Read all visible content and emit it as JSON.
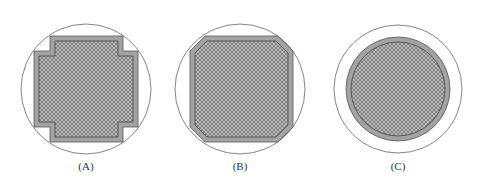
{
  "figure": {
    "panels": [
      {
        "id": "A",
        "label": "(A)",
        "shape": "stepped-cross",
        "cx": 86,
        "label_y": 161
      },
      {
        "id": "B",
        "label": "(B)",
        "shape": "octagon",
        "cx": 240,
        "label_y": 161
      },
      {
        "id": "C",
        "label": "(C)",
        "shape": "circle",
        "cx": 398,
        "label_y": 161
      }
    ],
    "colors": {
      "outline": "#555555",
      "band": "#a3a3a3",
      "hatch_bg": "#bdbdbd",
      "hatch_line": "#6f6f6f"
    }
  }
}
